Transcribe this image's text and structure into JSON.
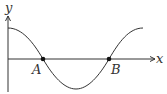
{
  "diagram": {
    "type": "cosine-curve-graph",
    "axes": {
      "x_label": "x",
      "y_label": "y"
    },
    "points": [
      {
        "label": "A",
        "description": "first x-intercept"
      },
      {
        "label": "B",
        "description": "second x-intercept"
      }
    ],
    "colors": {
      "stroke": "#333333",
      "background": "#ffffff"
    }
  }
}
